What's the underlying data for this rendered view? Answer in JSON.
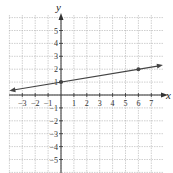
{
  "chart_data": {
    "type": "line",
    "title": "",
    "xlabel": "x",
    "ylabel": "y",
    "xlim": [
      -4,
      8
    ],
    "ylim": [
      -6,
      6
    ],
    "grid": true,
    "x_ticks": [
      "-3",
      "-2",
      "-1",
      "1",
      "2",
      "3",
      "4",
      "5",
      "6",
      "7"
    ],
    "y_ticks": [
      "5",
      "4",
      "3",
      "2",
      "1",
      "-1",
      "-2",
      "-3",
      "-4",
      "-5"
    ],
    "series": [
      {
        "name": "line",
        "equation": "y = (1/6)x + 1",
        "slope": 0.1667,
        "intercept": 1,
        "points": [
          {
            "x": 0,
            "y": 1
          },
          {
            "x": 6,
            "y": 2
          }
        ],
        "extends_both_directions": true
      }
    ]
  },
  "labels": {
    "x_axis": "x",
    "y_axis": "y"
  },
  "colors": {
    "grid": "#b0b0b0",
    "axis": "#333333",
    "line": "#444444"
  }
}
